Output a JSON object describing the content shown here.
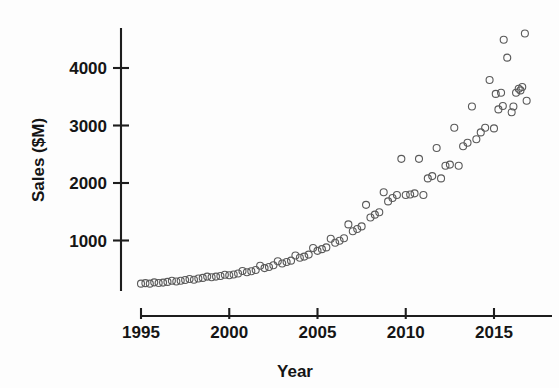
{
  "chart_data": {
    "type": "scatter",
    "title": "",
    "subtitle": "",
    "xlabel": "Year",
    "ylabel": "Sales ($M)",
    "xlim": [
      1994.6,
      2016.9
    ],
    "ylim": [
      0,
      4900
    ],
    "xticks": [
      1995,
      2000,
      2005,
      2010,
      2015
    ],
    "xticklabels": [
      "1995",
      "2000",
      "2005",
      "2010",
      "2015"
    ],
    "yticks": [
      1000,
      2000,
      3000,
      4000
    ],
    "yticklabels": [
      "1000",
      "2000",
      "3000",
      "4000"
    ],
    "grid": false,
    "legend": false,
    "legend_position": "none",
    "marker": {
      "shape": "circle-open",
      "diameter_px": 7,
      "stroke_color": "#5a5a5a",
      "stroke_width": 1.1,
      "fill": "none"
    },
    "axis_color": "#1d1d1d",
    "background_color": "#fdfdfd",
    "series": [
      {
        "name": "Quarterly sales",
        "points": [
          [
            1995.0,
            250
          ],
          [
            1995.25,
            258
          ],
          [
            1995.5,
            250
          ],
          [
            1995.75,
            272
          ],
          [
            1996.0,
            262
          ],
          [
            1996.25,
            268
          ],
          [
            1996.5,
            280
          ],
          [
            1996.75,
            300
          ],
          [
            1997.0,
            288
          ],
          [
            1997.25,
            300
          ],
          [
            1997.5,
            312
          ],
          [
            1997.75,
            330
          ],
          [
            1998.0,
            318
          ],
          [
            1998.25,
            340
          ],
          [
            1998.5,
            350
          ],
          [
            1998.75,
            372
          ],
          [
            1999.0,
            360
          ],
          [
            1999.25,
            372
          ],
          [
            1999.5,
            382
          ],
          [
            1999.75,
            405
          ],
          [
            2000.0,
            395
          ],
          [
            2000.25,
            410
          ],
          [
            2000.5,
            425
          ],
          [
            2000.75,
            470
          ],
          [
            2001.0,
            448
          ],
          [
            2001.25,
            465
          ],
          [
            2001.5,
            488
          ],
          [
            2001.75,
            560
          ],
          [
            2002.0,
            520
          ],
          [
            2002.25,
            540
          ],
          [
            2002.5,
            570
          ],
          [
            2002.75,
            640
          ],
          [
            2003.0,
            600
          ],
          [
            2003.25,
            625
          ],
          [
            2003.5,
            650
          ],
          [
            2003.75,
            740
          ],
          [
            2004.0,
            700
          ],
          [
            2004.25,
            720
          ],
          [
            2004.5,
            755
          ],
          [
            2004.75,
            870
          ],
          [
            2005.0,
            820
          ],
          [
            2005.25,
            850
          ],
          [
            2005.5,
            880
          ],
          [
            2005.75,
            1030
          ],
          [
            2006.0,
            960
          ],
          [
            2006.25,
            995
          ],
          [
            2006.5,
            1040
          ],
          [
            2006.75,
            1280
          ],
          [
            2007.0,
            1160
          ],
          [
            2007.25,
            1200
          ],
          [
            2007.5,
            1245
          ],
          [
            2007.75,
            1620
          ],
          [
            2008.0,
            1400
          ],
          [
            2008.25,
            1450
          ],
          [
            2008.5,
            1490
          ],
          [
            2008.75,
            1840
          ],
          [
            2009.0,
            1680
          ],
          [
            2009.25,
            1740
          ],
          [
            2009.5,
            1790
          ],
          [
            2009.75,
            2420
          ],
          [
            2010.0,
            1790
          ],
          [
            2010.25,
            1800
          ],
          [
            2010.5,
            1820
          ],
          [
            2010.75,
            2420
          ],
          [
            2011.0,
            1790
          ],
          [
            2011.25,
            2080
          ],
          [
            2011.5,
            2120
          ],
          [
            2011.75,
            2610
          ],
          [
            2012.0,
            2080
          ],
          [
            2012.25,
            2300
          ],
          [
            2012.5,
            2320
          ],
          [
            2012.75,
            2960
          ],
          [
            2013.0,
            2300
          ],
          [
            2013.25,
            2640
          ],
          [
            2013.5,
            2700
          ],
          [
            2013.75,
            3330
          ],
          [
            2014.0,
            2760
          ],
          [
            2014.25,
            2880
          ],
          [
            2014.5,
            2960
          ],
          [
            2014.75,
            3790
          ],
          [
            2015.0,
            2950
          ],
          [
            2015.25,
            3280
          ],
          [
            2015.5,
            3340
          ],
          [
            2015.75,
            4180
          ],
          [
            2016.0,
            3230
          ],
          [
            2016.25,
            3570
          ],
          [
            2016.5,
            3610
          ],
          [
            2016.75,
            4600
          ],
          [
            2015.1,
            3550
          ],
          [
            2015.4,
            3570
          ],
          [
            2016.1,
            3330
          ],
          [
            2016.4,
            3640
          ],
          [
            2016.6,
            3670
          ],
          [
            2016.85,
            3430
          ],
          [
            2015.55,
            4490
          ]
        ]
      }
    ]
  }
}
